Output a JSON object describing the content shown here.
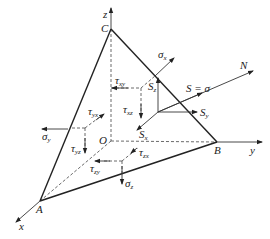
{
  "diagram": {
    "points": {
      "C": "C",
      "B": "B",
      "A": "A",
      "O": "O"
    },
    "axes": {
      "x": "x",
      "y": "y",
      "z": "z"
    },
    "normal": "N",
    "resultant": "S = σ",
    "components": {
      "Sx": {
        "main": "S",
        "sub": "x"
      },
      "Sy": {
        "main": "S",
        "sub": "y"
      },
      "Sz": {
        "main": "S",
        "sub": "z"
      }
    },
    "stresses": {
      "sigma_x": {
        "main": "σ",
        "sub": "x"
      },
      "sigma_y": {
        "main": "σ",
        "sub": "y"
      },
      "sigma_z": {
        "main": "σ",
        "sub": "z"
      },
      "tau_xy": {
        "main": "τ",
        "sub": "xy"
      },
      "tau_xz": {
        "main": "τ",
        "sub": "xz"
      },
      "tau_yx": {
        "main": "τ",
        "sub": "yx"
      },
      "tau_yz": {
        "main": "τ",
        "sub": "yz"
      },
      "tau_zx": {
        "main": "τ",
        "sub": "zx"
      },
      "tau_zy": {
        "main": "τ",
        "sub": "zy"
      }
    },
    "colors": {
      "line": "#222222",
      "background": "#ffffff"
    }
  }
}
